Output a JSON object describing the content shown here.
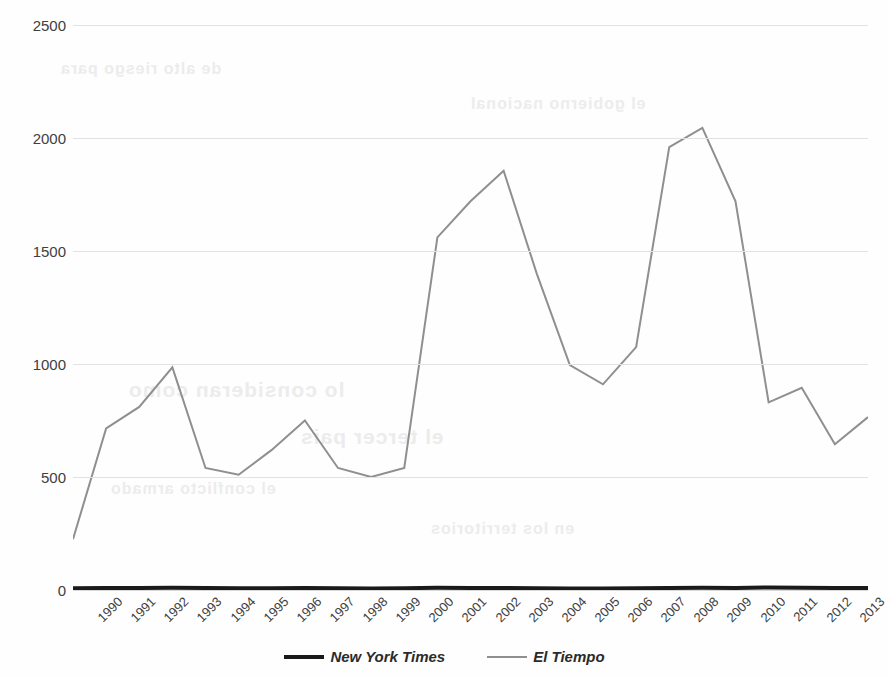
{
  "chart_data": {
    "type": "line",
    "title": "",
    "xlabel": "",
    "ylabel": "",
    "categories": [
      "1990",
      "1991",
      "1992",
      "1993",
      "1994",
      "1995",
      "1996",
      "1997",
      "1998",
      "1999",
      "2000",
      "2001",
      "2002",
      "2003",
      "2004",
      "2005",
      "2006",
      "2007",
      "2008",
      "2009",
      "2010",
      "2011",
      "2012",
      "2013",
      "2014"
    ],
    "ylim": [
      0,
      2500
    ],
    "yticks": [
      0,
      500,
      1000,
      1500,
      2000,
      2500
    ],
    "ytick_labels": [
      "0",
      "500",
      "1000",
      "1500",
      "2000",
      "2500"
    ],
    "grid": true,
    "legend_position": "bottom",
    "series": [
      {
        "name": "New York Times",
        "color": "#1a1a1a",
        "line_width": 4,
        "values": [
          8,
          9,
          9,
          10,
          9,
          8,
          8,
          9,
          8,
          7,
          8,
          10,
          9,
          9,
          8,
          7,
          7,
          8,
          9,
          10,
          9,
          11,
          10,
          9,
          9
        ]
      },
      {
        "name": "El Tiempo",
        "color": "#8f8f8f",
        "line_width": 2,
        "values": [
          225,
          715,
          810,
          985,
          540,
          510,
          620,
          750,
          540,
          500,
          540,
          1560,
          1720,
          1855,
          1400,
          995,
          910,
          1075,
          1960,
          2045,
          1720,
          830,
          895,
          645,
          765
        ]
      }
    ]
  },
  "legend": {
    "items": [
      {
        "label": "New York Times",
        "swatch": "thick-black-line"
      },
      {
        "label": "El Tiempo",
        "swatch": "thin-gray-line"
      }
    ]
  },
  "background_bleed": {
    "line_1": "lo consideran como",
    "line_2": "el tercer pais",
    "line_3": "de alto riesgo para",
    "line_4": "el gobierno nacional",
    "line_5": "el conflicto armado",
    "line_6": "en los territorios"
  }
}
